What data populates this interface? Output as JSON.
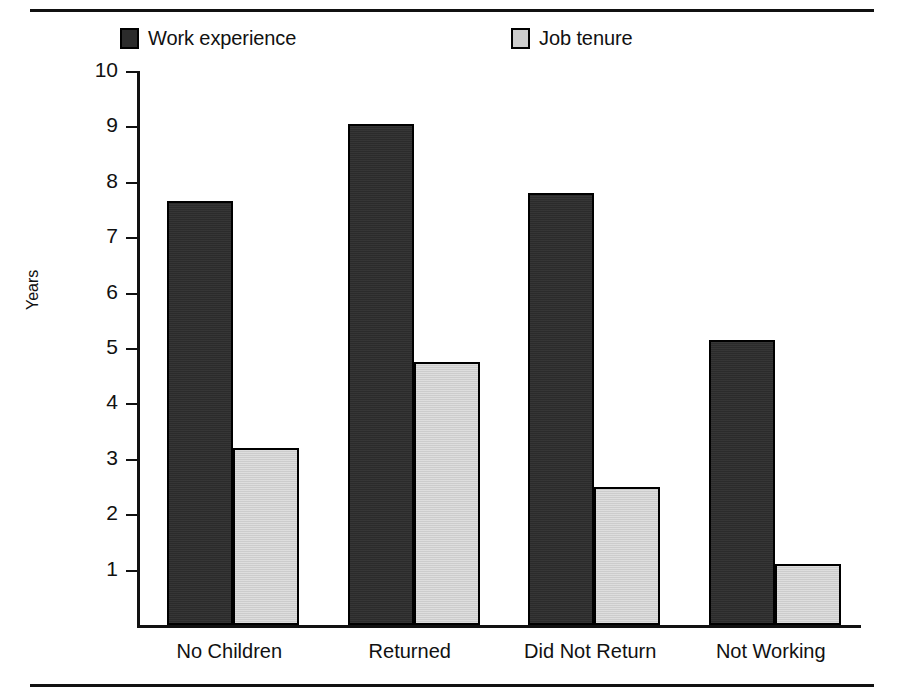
{
  "figure": {
    "frame_top_rule": "horizontal-rule",
    "frame_bottom_rule": "horizontal-rule"
  },
  "legend": {
    "entries": [
      {
        "label": "Work experience",
        "swatch_color": "#2b2b2b",
        "icon": "filled-square-dark"
      },
      {
        "label": "Job tenure",
        "swatch_color": "#cccccc",
        "icon": "filled-square-light"
      }
    ]
  },
  "axes": {
    "y_title": "Years",
    "y_ticks": [
      "10",
      "9",
      "8",
      "7",
      "6",
      "5",
      "4",
      "3",
      "2",
      "1"
    ],
    "x_categories": [
      "No Children",
      "Returned",
      "Did Not Return",
      "Not Working"
    ]
  },
  "chart_data": {
    "type": "bar",
    "title": "",
    "xlabel": "",
    "ylabel": "Years",
    "ylim": [
      0,
      10
    ],
    "y_ticks": [
      1,
      2,
      3,
      4,
      5,
      6,
      7,
      8,
      9,
      10
    ],
    "grid": false,
    "legend_position": "top",
    "categories": [
      "No Children",
      "Returned",
      "Did Not Return",
      "Not Working"
    ],
    "series": [
      {
        "name": "Work experience",
        "color": "#2b2b2b",
        "values": [
          7.65,
          9.05,
          7.8,
          5.15
        ]
      },
      {
        "name": "Job tenure",
        "color": "#cccccc",
        "values": [
          3.2,
          4.75,
          2.5,
          1.1
        ]
      }
    ]
  }
}
